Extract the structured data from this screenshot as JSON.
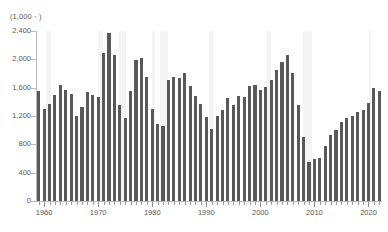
{
  "chart_data": {
    "type": "bar",
    "title": "",
    "subtitle": "",
    "unit_label": "(1,000ㆍ)",
    "xlabel": "",
    "ylabel": "",
    "ylim": [
      0,
      2400
    ],
    "xlim": [
      1958.5,
      2022.5
    ],
    "grid": false,
    "legend": null,
    "bar_color": "#595959",
    "recession_band_color": "#f4f4f4",
    "axis_color": "#b9b9b9",
    "text_color": "#58585a",
    "ytick_labels": [
      "0",
      "400",
      "800",
      "1,200",
      "1,600",
      "2,000",
      "2,400"
    ],
    "ytick_values": [
      0,
      400,
      800,
      1200,
      1600,
      2000,
      2400
    ],
    "xtick_labels": [
      "1960",
      "1970",
      "1980",
      "1990",
      "2000",
      "2010",
      "2020"
    ],
    "xtick_values": [
      1960,
      1970,
      1980,
      1990,
      2000,
      2010,
      2020
    ],
    "x_minor_tick_step": 1,
    "categories": [
      1959,
      1960,
      1961,
      1962,
      1963,
      1964,
      1965,
      1966,
      1967,
      1968,
      1969,
      1970,
      1971,
      1972,
      1973,
      1974,
      1975,
      1976,
      1977,
      1978,
      1979,
      1980,
      1981,
      1982,
      1983,
      1984,
      1985,
      1986,
      1987,
      1988,
      1989,
      1990,
      1991,
      1992,
      1993,
      1994,
      1995,
      1996,
      1997,
      1998,
      1999,
      2000,
      2001,
      2002,
      2003,
      2004,
      2005,
      2006,
      2007,
      2008,
      2009,
      2010,
      2011,
      2012,
      2013,
      2014,
      2015,
      2016,
      2017,
      2018,
      2019,
      2020,
      2021,
      2022
    ],
    "values": [
      1554,
      1296,
      1365,
      1493,
      1635,
      1561,
      1510,
      1196,
      1322,
      1545,
      1500,
      1469,
      2085,
      2379,
      2057,
      1353,
      1171,
      1548,
      1990,
      2023,
      1745,
      1292,
      1084,
      1062,
      1703,
      1750,
      1742,
      1805,
      1621,
      1488,
      1376,
      1193,
      1014,
      1200,
      1288,
      1457,
      1354,
      1477,
      1474,
      1617,
      1641,
      1569,
      1603,
      1705,
      1848,
      1956,
      2068,
      1801,
      1355,
      906,
      554,
      587,
      609,
      781,
      925,
      1003,
      1112,
      1174,
      1203,
      1250,
      1290,
      1380,
      1601,
      1553
    ],
    "recession_bands": [
      {
        "start": 1960.3,
        "end": 1961.2
      },
      {
        "start": 1969.9,
        "end": 1970.9
      },
      {
        "start": 1973.9,
        "end": 1975.2
      },
      {
        "start": 1980.0,
        "end": 1980.6
      },
      {
        "start": 1981.5,
        "end": 1982.9
      },
      {
        "start": 1990.5,
        "end": 1991.2
      },
      {
        "start": 2001.2,
        "end": 2001.9
      },
      {
        "start": 2007.9,
        "end": 2009.5
      },
      {
        "start": 2020.1,
        "end": 2020.4
      }
    ]
  }
}
